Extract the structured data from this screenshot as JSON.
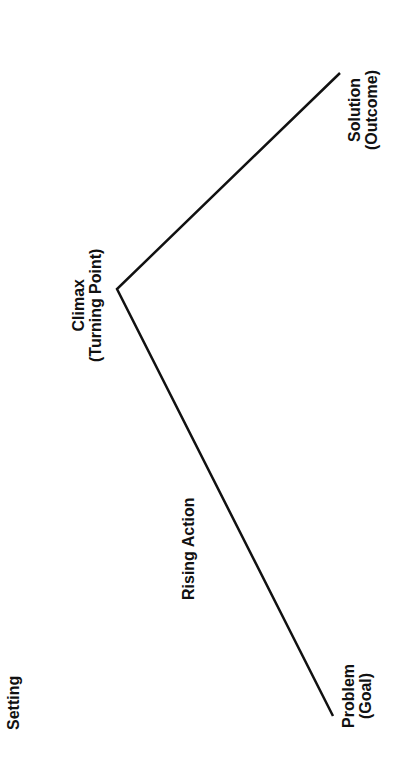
{
  "diagram": {
    "type": "plot-line",
    "orientation": "rotated-90-ccw",
    "line_color": "#111111",
    "background": "#ffffff",
    "points": [
      {
        "name": "problem",
        "x": 333,
        "y": 716
      },
      {
        "name": "climax",
        "x": 117,
        "y": 289
      },
      {
        "name": "solution",
        "x": 340,
        "y": 73
      }
    ],
    "labels": {
      "setting": {
        "line1": "Setting"
      },
      "rising_action": {
        "line1": "Rising Action"
      },
      "problem": {
        "line1": "Problem",
        "line2": "(Goal)"
      },
      "climax": {
        "line1": "Climax",
        "line2": "(Turning Point)"
      },
      "solution": {
        "line1": "Solution",
        "line2": "(Outcome)"
      }
    }
  }
}
